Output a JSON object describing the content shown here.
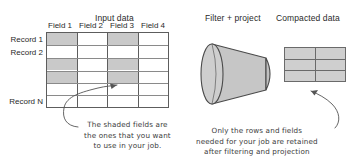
{
  "diagram": {
    "headings": {
      "input": "Input data",
      "filter": "Filter + project",
      "compacted": "Compacted data"
    },
    "input_table": {
      "field_headers": [
        "Field 1",
        "Field 2",
        "Field 3",
        "Field 4"
      ],
      "record_labels": [
        "Record 1",
        "Record 2",
        "Record N"
      ],
      "row_count": 6,
      "column_count": 4,
      "shaded_columns": [
        1,
        3
      ],
      "shaded_rows": [
        1,
        3,
        4
      ],
      "shade_color": "#c9c9c9",
      "border_color": "#5d5d5d"
    },
    "funnel": {
      "shape": "cone",
      "fill_color": "#c6c6c6",
      "stroke_color": "#4a4a4a"
    },
    "compacted_table": {
      "row_count": 3,
      "column_count": 2,
      "fill_color": "#cfcfcf",
      "border_color": "#6a6a6a"
    },
    "annotations": {
      "left": [
        "The shaded fields are",
        "the ones that you want",
        "to use in your job."
      ],
      "right": [
        "Only the rows and fields",
        "needed for your job are retained",
        "after filtering and projection"
      ]
    }
  }
}
